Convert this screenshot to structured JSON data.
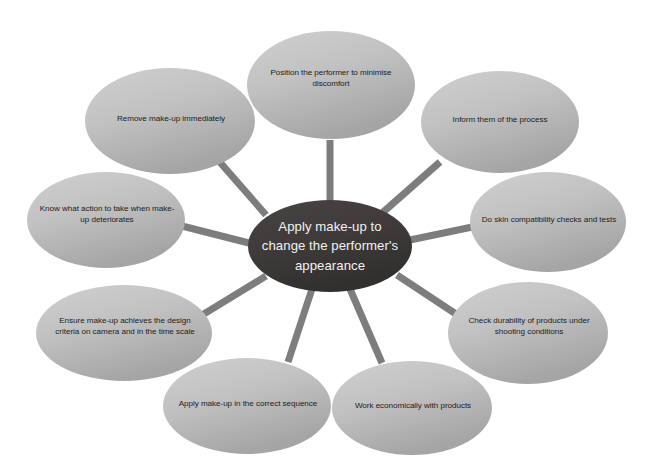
{
  "diagram": {
    "type": "radial-mind-map",
    "canvas": {
      "width": 659,
      "height": 475,
      "background": "#ffffff"
    },
    "colors": {
      "center_fill_dark": "#3b3838",
      "center_fill_light": "#4a4545",
      "center_text": "#f2f2f2",
      "satellite_fill_light": "#c9c9c9",
      "satellite_fill_dark": "#a8a8a8",
      "satellite_text": "#1c1c1c",
      "connector": "#7d7d7d"
    },
    "center": {
      "label": "Apply make-up to change the performer's appearance",
      "lines": [
        "Apply make-up to",
        "change the performer's",
        "appearance"
      ],
      "cx": 330,
      "cy": 246,
      "rx": 82,
      "ry": 46
    },
    "satellites": [
      {
        "id": "position-performer",
        "label": "Position the performer to minimise discomfort",
        "lines": [
          "Position the performer to minimise",
          "discomfort"
        ],
        "cx": 331,
        "cy": 85,
        "rx": 84,
        "ry": 54,
        "label_box": {
          "x": 252,
          "y": 62,
          "w": 158,
          "h": 32
        }
      },
      {
        "id": "inform-them",
        "label": "Inform them of the process",
        "lines": [
          "Inform them of the process"
        ],
        "cx": 500,
        "cy": 122,
        "rx": 79,
        "ry": 51,
        "label_box": {
          "x": 428,
          "y": 108,
          "w": 144,
          "h": 24
        }
      },
      {
        "id": "skin-compatibility",
        "label": "Do skin compatibility checks and tests",
        "lines": [
          "Do skin compatibility checks and tests"
        ],
        "cx": 548,
        "cy": 222,
        "rx": 78,
        "ry": 50,
        "label_box": {
          "x": 474,
          "y": 208,
          "w": 150,
          "h": 24
        }
      },
      {
        "id": "check-durability",
        "label": "Check durability of products under shooting conditions",
        "lines": [
          "Check durability of products under",
          "shooting conditions"
        ],
        "cx": 528,
        "cy": 333,
        "rx": 80,
        "ry": 51,
        "label_box": {
          "x": 452,
          "y": 310,
          "w": 154,
          "h": 32
        }
      },
      {
        "id": "work-economically",
        "label": "Work economically with products",
        "lines": [
          "Work economically with products"
        ],
        "cx": 412,
        "cy": 408,
        "rx": 80,
        "ry": 47,
        "label_box": {
          "x": 340,
          "y": 394,
          "w": 146,
          "h": 24
        }
      },
      {
        "id": "correct-sequence",
        "label": "Apply make-up in the correct sequence",
        "lines": [
          "Apply make-up in the correct sequence"
        ],
        "cx": 247,
        "cy": 406,
        "rx": 84,
        "ry": 48,
        "label_box": {
          "x": 170,
          "y": 392,
          "w": 156,
          "h": 24
        }
      },
      {
        "id": "design-criteria",
        "label": "Ensure make-up achieves the design criteria on camera and in the time scale",
        "lines": [
          "Ensure make-up achieves the design",
          "criteria on camera and in the time scale"
        ],
        "cx": 124,
        "cy": 333,
        "rx": 88,
        "ry": 48,
        "label_box": {
          "x": 42,
          "y": 310,
          "w": 166,
          "h": 32
        }
      },
      {
        "id": "make-up-deteriorates",
        "label": "Know what action to take when make-up deteriorates",
        "lines": [
          "Know what action to take when make-",
          "up deteriorates"
        ],
        "cx": 106,
        "cy": 220,
        "rx": 79,
        "ry": 48,
        "label_box": {
          "x": 29,
          "y": 198,
          "w": 156,
          "h": 32
        }
      },
      {
        "id": "remove-make-up",
        "label": "Remove make-up immediately",
        "lines": [
          "Remove make-up immediately"
        ],
        "cx": 170,
        "cy": 121,
        "rx": 85,
        "ry": 53,
        "label_box": {
          "x": 98,
          "y": 107,
          "w": 146,
          "h": 24
        }
      }
    ],
    "connectors": [
      {
        "id": "connector-position-performer",
        "x1": 330,
        "y1": 205,
        "x2": 330,
        "y2": 140
      },
      {
        "id": "connector-inform-them",
        "x1": 381,
        "y1": 214,
        "x2": 440,
        "y2": 162
      },
      {
        "id": "connector-skin-compatibility",
        "x1": 410,
        "y1": 240,
        "x2": 477,
        "y2": 226
      },
      {
        "id": "connector-check-durability",
        "x1": 397,
        "y1": 275,
        "x2": 462,
        "y2": 318
      },
      {
        "id": "connector-work-economically",
        "x1": 350,
        "y1": 289,
        "x2": 382,
        "y2": 363
      },
      {
        "id": "connector-correct-sequence",
        "x1": 312,
        "y1": 289,
        "x2": 288,
        "y2": 362
      },
      {
        "id": "connector-design-criteria",
        "x1": 266,
        "y1": 276,
        "x2": 194,
        "y2": 320
      },
      {
        "id": "connector-make-up-deteriorates",
        "x1": 249,
        "y1": 243,
        "x2": 182,
        "y2": 226
      },
      {
        "id": "connector-remove-make-up",
        "x1": 266,
        "y1": 215,
        "x2": 218,
        "y2": 160
      }
    ]
  }
}
